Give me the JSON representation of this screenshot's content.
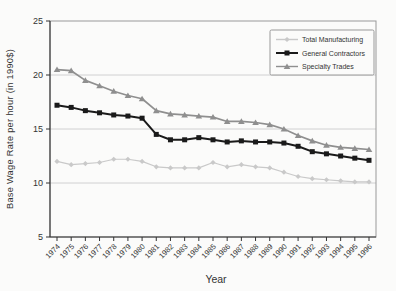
{
  "window": {
    "kind": "static-chart-figure"
  },
  "chart_data": {
    "type": "line",
    "title": "",
    "xlabel": "Year",
    "ylabel": "Base Wage Rate per hour (in 1990$)",
    "ylim": [
      5,
      25
    ],
    "yticks": [
      25,
      20,
      15,
      10,
      5
    ],
    "gridlines": [
      20,
      15,
      10
    ],
    "grid": "horizontal",
    "legend_position": "top-right",
    "legend_entries": [
      "Total Manufacturing",
      "General Contractors",
      "Specialty Trades"
    ],
    "categories": [
      "1974",
      "1975",
      "1976",
      "1977",
      "1978",
      "1979",
      "1980",
      "1981",
      "1982",
      "1983",
      "1984",
      "1985",
      "1986",
      "1987",
      "1988",
      "1989",
      "1990",
      "1991",
      "1992",
      "1993",
      "1994",
      "1995",
      "1996"
    ],
    "series": [
      {
        "name": "Total Manufacturing",
        "marker": "diamond",
        "color": "#c9c9c9",
        "line_width": 1.2,
        "values": [
          12.0,
          11.7,
          11.8,
          11.9,
          12.2,
          12.2,
          12.0,
          11.5,
          11.4,
          11.4,
          11.4,
          11.9,
          11.5,
          11.7,
          11.5,
          11.4,
          11.0,
          10.6,
          10.4,
          10.3,
          10.2,
          10.1,
          10.1
        ]
      },
      {
        "name": "General Contractors",
        "marker": "square",
        "color": "#1a1a1a",
        "line_width": 2.0,
        "values": [
          17.2,
          17.0,
          16.7,
          16.5,
          16.3,
          16.2,
          16.0,
          14.5,
          14.0,
          14.0,
          14.2,
          14.0,
          13.8,
          13.9,
          13.8,
          13.8,
          13.7,
          13.4,
          12.9,
          12.7,
          12.5,
          12.3,
          12.1
        ]
      },
      {
        "name": "Specialty Trades",
        "marker": "triangle",
        "color": "#8f8f8f",
        "line_width": 1.7,
        "values": [
          20.5,
          20.4,
          19.5,
          19.0,
          18.5,
          18.1,
          17.8,
          16.7,
          16.4,
          16.3,
          16.2,
          16.1,
          15.7,
          15.7,
          15.6,
          15.4,
          15.0,
          14.4,
          13.9,
          13.5,
          13.3,
          13.2,
          13.1
        ]
      }
    ],
    "colors": {
      "grid": "#c6c6c6",
      "frame": "#999999",
      "axis": "#333333",
      "text": "#333333",
      "legend_bg": "#fbfbfa"
    }
  }
}
